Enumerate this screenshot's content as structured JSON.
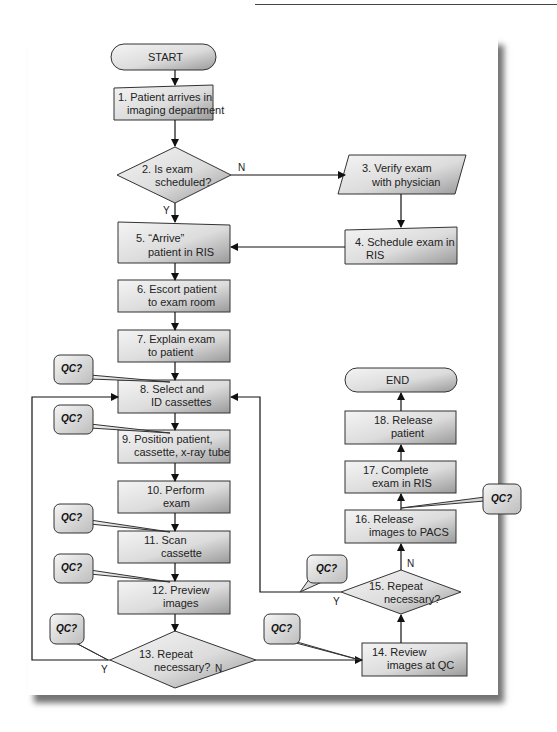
{
  "diagram": {
    "type": "flowchart",
    "title": "",
    "terminals": {
      "start": "START",
      "end": "END"
    },
    "steps": [
      {
        "id": 1,
        "shape": "manual-input",
        "line1": "1. Patient arrives in",
        "line2": "imaging department"
      },
      {
        "id": 2,
        "shape": "decision",
        "line1": "2. Is exam",
        "line2": "scheduled?"
      },
      {
        "id": 3,
        "shape": "parallelogram",
        "line1": "3. Verify exam",
        "line2": "with physician"
      },
      {
        "id": 4,
        "shape": "manual-input",
        "line1": "4. Schedule exam in",
        "line2": "RIS"
      },
      {
        "id": 5,
        "shape": "manual-input",
        "line1": "5. “Arrive”",
        "line2": "patient in RIS"
      },
      {
        "id": 6,
        "shape": "process",
        "line1": "6. Escort patient",
        "line2": "to exam room"
      },
      {
        "id": 7,
        "shape": "process",
        "line1": "7. Explain exam",
        "line2": "to patient"
      },
      {
        "id": 8,
        "shape": "process",
        "line1": "8. Select and",
        "line2": "ID cassettes"
      },
      {
        "id": 9,
        "shape": "process",
        "line1": "9. Position patient,",
        "line2": "cassette, x-ray tube"
      },
      {
        "id": 10,
        "shape": "process",
        "line1": "10. Perform",
        "line2": "exam"
      },
      {
        "id": 11,
        "shape": "process",
        "line1": "11. Scan",
        "line2": "cassette"
      },
      {
        "id": 12,
        "shape": "process",
        "line1": "12. Preview",
        "line2": "images"
      },
      {
        "id": 13,
        "shape": "decision",
        "line1": "13. Repeat",
        "line2": "necessary?"
      },
      {
        "id": 14,
        "shape": "process",
        "line1": "14. Review",
        "line2": "images at QC"
      },
      {
        "id": 15,
        "shape": "decision",
        "line1": "15. Repeat",
        "line2": "necessary?"
      },
      {
        "id": 16,
        "shape": "process",
        "line1": "16. Release",
        "line2": "images to PACS"
      },
      {
        "id": 17,
        "shape": "process",
        "line1": "17. Complete",
        "line2": "exam in RIS"
      },
      {
        "id": 18,
        "shape": "process",
        "line1": "18. Release",
        "line2": "patient"
      }
    ],
    "branch_labels": {
      "yes": "Y",
      "no": "N"
    },
    "callout_label": "QC?",
    "callouts_near_steps": [
      8,
      9,
      11,
      12,
      13,
      14,
      15,
      16
    ],
    "edges": [
      [
        "START",
        1
      ],
      [
        1,
        2
      ],
      [
        2,
        3,
        "N"
      ],
      [
        2,
        5,
        "Y"
      ],
      [
        3,
        4
      ],
      [
        4,
        5
      ],
      [
        5,
        6
      ],
      [
        6,
        7
      ],
      [
        7,
        8
      ],
      [
        8,
        9
      ],
      [
        9,
        10
      ],
      [
        10,
        11
      ],
      [
        11,
        12
      ],
      [
        12,
        13
      ],
      [
        13,
        8,
        "Y"
      ],
      [
        13,
        14,
        "N"
      ],
      [
        14,
        15
      ],
      [
        15,
        8,
        "Y"
      ],
      [
        15,
        16,
        "N"
      ],
      [
        16,
        17
      ],
      [
        17,
        18
      ],
      [
        18,
        "END"
      ]
    ],
    "colors": {
      "fill_light": "#f2f2f2",
      "fill_dark": "#a9a9a9",
      "stroke": "#333333"
    }
  }
}
